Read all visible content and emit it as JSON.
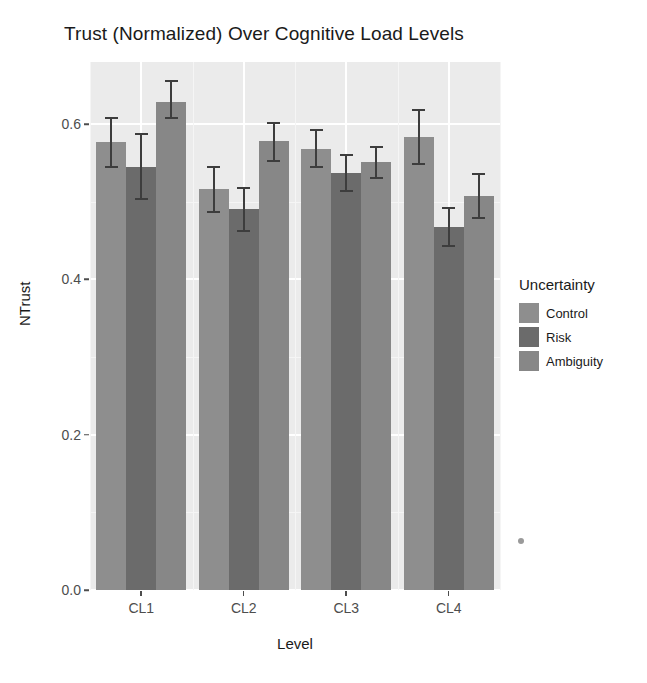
{
  "chart_data": {
    "type": "bar",
    "title": "Trust (Normalized) Over Cognitive Load Levels",
    "xlabel": "Level",
    "ylabel": "NTrust",
    "categories": [
      "CL1",
      "CL2",
      "CL3",
      "CL4"
    ],
    "ylim": [
      0.0,
      0.68
    ],
    "yticks": [
      0.0,
      0.2,
      0.4,
      0.6
    ],
    "ytick_labels": [
      "0.0",
      "0.2",
      "0.4",
      "0.6"
    ],
    "grid": true,
    "legend_position": "right",
    "legend_title": "Uncertainty",
    "series": [
      {
        "name": "Control",
        "color": "#8e8e8e",
        "values": [
          0.577,
          0.517,
          0.568,
          0.583
        ],
        "err_low": [
          0.545,
          0.487,
          0.545,
          0.548
        ],
        "err_high": [
          0.608,
          0.545,
          0.592,
          0.618
        ]
      },
      {
        "name": "Risk",
        "color": "#6b6b6b",
        "values": [
          0.545,
          0.491,
          0.537,
          0.467
        ],
        "err_low": [
          0.503,
          0.462,
          0.514,
          0.443
        ],
        "err_high": [
          0.587,
          0.518,
          0.56,
          0.492
        ]
      },
      {
        "name": "Ambiguity",
        "color": "#878787",
        "values": [
          0.629,
          0.578,
          0.551,
          0.508
        ],
        "err_low": [
          0.608,
          0.553,
          0.531,
          0.479
        ],
        "err_high": [
          0.656,
          0.602,
          0.57,
          0.536
        ]
      }
    ]
  },
  "legend": {
    "title": "Uncertainty",
    "items": [
      {
        "label": "Control",
        "color": "#8e8e8e"
      },
      {
        "label": "Risk",
        "color": "#6b6b6b"
      },
      {
        "label": "Ambiguity",
        "color": "#878787"
      }
    ]
  },
  "axes": {
    "y_title": "NTrust",
    "x_title": "Level",
    "y_tick_labels": [
      "0.0",
      "0.2",
      "0.4",
      "0.6"
    ],
    "x_tick_labels": [
      "CL1",
      "CL2",
      "CL3",
      "CL4"
    ]
  },
  "title": "Trust (Normalized) Over Cognitive Load Levels",
  "theme": {
    "panel_background": "#ebebeb",
    "grid_color": "#ffffff",
    "plot_background": "#ffffff",
    "text_color": "#1a1a1a"
  }
}
